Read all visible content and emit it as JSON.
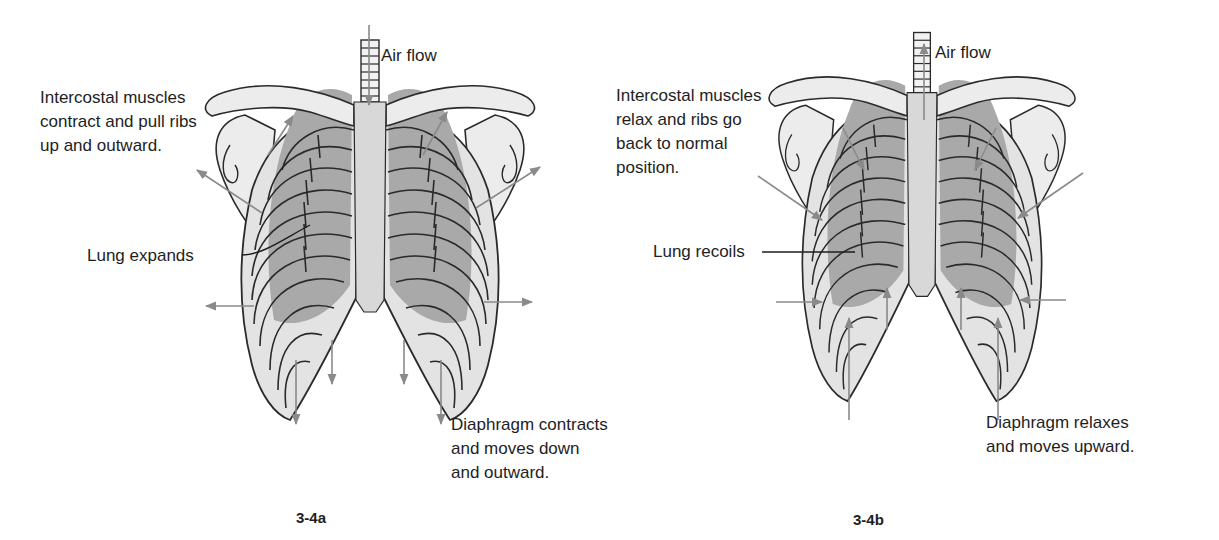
{
  "colors": {
    "bone": "#e6e6e6",
    "bone_outline": "#2a2a2a",
    "lung": "#a9a9a9",
    "lung_dark": "#8f8f8f",
    "sternum": "#d9d9d9",
    "arrow": "#8a8a8a",
    "text": "#1e1e1e"
  },
  "panel_a": {
    "caption": "3-4a",
    "labels": {
      "airflow": "Air flow",
      "intercostal": "Intercostal muscles\ncontract and pull ribs\nup and outward.",
      "lung": "Lung expands",
      "diaphragm": "Diaphragm contracts\nand moves down\nand outward."
    },
    "arrows": [
      {
        "name": "airflow-arrow",
        "x1": 369,
        "y1": 25,
        "x2": 369,
        "y2": 105
      },
      {
        "name": "rib-up-left-arrow",
        "x1": 268,
        "y1": 155,
        "x2": 293,
        "y2": 116
      },
      {
        "name": "rib-up-right-arrow",
        "x1": 423,
        "y1": 155,
        "x2": 447,
        "y2": 112
      },
      {
        "name": "shoulder-left-arrow",
        "x1": 262,
        "y1": 213,
        "x2": 197,
        "y2": 170
      },
      {
        "name": "shoulder-right-arrow",
        "x1": 476,
        "y1": 208,
        "x2": 540,
        "y2": 167
      },
      {
        "name": "side-left-arrow",
        "x1": 254,
        "y1": 306,
        "x2": 206,
        "y2": 306
      },
      {
        "name": "side-right-arrow",
        "x1": 484,
        "y1": 302,
        "x2": 532,
        "y2": 302
      },
      {
        "name": "diaphragm-down-1-arrow",
        "x1": 296,
        "y1": 360,
        "x2": 296,
        "y2": 424
      },
      {
        "name": "diaphragm-down-2-arrow",
        "x1": 332,
        "y1": 340,
        "x2": 332,
        "y2": 384
      },
      {
        "name": "diaphragm-down-3-arrow",
        "x1": 404,
        "y1": 340,
        "x2": 404,
        "y2": 384
      },
      {
        "name": "diaphragm-down-4-arrow",
        "x1": 441,
        "y1": 360,
        "x2": 441,
        "y2": 424
      }
    ]
  },
  "panel_b": {
    "caption": "3-4b",
    "labels": {
      "airflow": "Air flow",
      "intercostal": "Intercostal muscles\nrelax and ribs go\nback to normal\nposition.",
      "lung": "Lung recoils",
      "diaphragm": "Diaphragm relaxes\nand moves upward."
    },
    "arrows": [
      {
        "name": "airflow-arrow",
        "x1": 924,
        "y1": 120,
        "x2": 924,
        "y2": 44
      },
      {
        "name": "rib-in-left-arrow",
        "x1": 843,
        "y1": 128,
        "x2": 864,
        "y2": 170
      },
      {
        "name": "rib-in-right-arrow",
        "x1": 996,
        "y1": 128,
        "x2": 975,
        "y2": 170
      },
      {
        "name": "shoulder-in-left-arrow",
        "x1": 758,
        "y1": 176,
        "x2": 822,
        "y2": 220
      },
      {
        "name": "shoulder-in-right-arrow",
        "x1": 1083,
        "y1": 173,
        "x2": 1018,
        "y2": 218
      },
      {
        "name": "side-in-left-arrow",
        "x1": 776,
        "y1": 302,
        "x2": 822,
        "y2": 302
      },
      {
        "name": "side-in-right-arrow",
        "x1": 1066,
        "y1": 300,
        "x2": 1020,
        "y2": 300
      },
      {
        "name": "diaphragm-up-1-arrow",
        "x1": 849,
        "y1": 420,
        "x2": 849,
        "y2": 318
      },
      {
        "name": "diaphragm-up-2-arrow",
        "x1": 887,
        "y1": 330,
        "x2": 887,
        "y2": 288
      },
      {
        "name": "diaphragm-up-3-arrow",
        "x1": 961,
        "y1": 330,
        "x2": 961,
        "y2": 288
      },
      {
        "name": "diaphragm-up-4-arrow",
        "x1": 998,
        "y1": 420,
        "x2": 998,
        "y2": 318
      }
    ]
  }
}
